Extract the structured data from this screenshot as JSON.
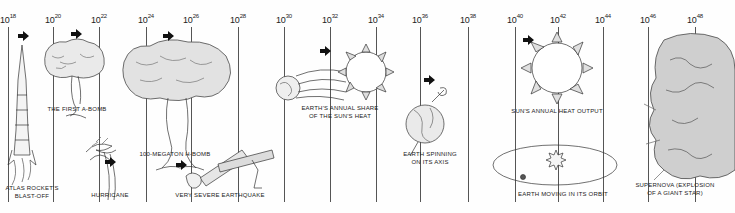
{
  "diagram": {
    "axis": {
      "base": "10",
      "ticks": [
        {
          "exp": "18",
          "x": 8
        },
        {
          "exp": "20",
          "x": 53
        },
        {
          "exp": "22",
          "x": 99
        },
        {
          "exp": "24",
          "x": 146
        },
        {
          "exp": "26",
          "x": 191
        },
        {
          "exp": "28",
          "x": 238
        },
        {
          "exp": "30",
          "x": 284
        },
        {
          "exp": "32",
          "x": 330
        },
        {
          "exp": "34",
          "x": 376
        },
        {
          "exp": "36",
          "x": 420
        },
        {
          "exp": "38",
          "x": 468
        },
        {
          "exp": "40",
          "x": 515
        },
        {
          "exp": "42",
          "x": 558
        },
        {
          "exp": "44",
          "x": 603
        },
        {
          "exp": "46",
          "x": 648
        },
        {
          "exp": "48",
          "x": 695
        }
      ]
    },
    "events": [
      {
        "id": "atlas",
        "label_line1": "ATLAS ROCKET'S",
        "label_line2": "BLAST-OFF"
      },
      {
        "id": "abomb",
        "label_line1": "THE FIRST A-BOMB",
        "label_line2": ""
      },
      {
        "id": "hurricane",
        "label_line1": "HURRICANE",
        "label_line2": ""
      },
      {
        "id": "hbomb",
        "label_line1": "100-MEGATON H-BOMB",
        "label_line2": ""
      },
      {
        "id": "quake",
        "label_line1": "VERY SEVERE EARTHQUAKE",
        "label_line2": ""
      },
      {
        "id": "sunshare",
        "label_line1": "EARTH'S ANNUAL SHARE",
        "label_line2": "OF THE SUN'S HEAT"
      },
      {
        "id": "spin",
        "label_line1": "EARTH SPINNING",
        "label_line2": "ON ITS AXIS"
      },
      {
        "id": "sunout",
        "label_line1": "SUN'S ANNUAL HEAT OUTPUT",
        "label_line2": ""
      },
      {
        "id": "orbit",
        "label_line1": "EARTH MOVING IN ITS ORBIT",
        "label_line2": ""
      },
      {
        "id": "supernova",
        "label_line1": "SUPERNOVA (EXPLOSION",
        "label_line2": "OF A GIANT STAR)"
      }
    ],
    "colors": {
      "ink": "#222222",
      "line": "#555555",
      "background": "#fefefe"
    }
  }
}
